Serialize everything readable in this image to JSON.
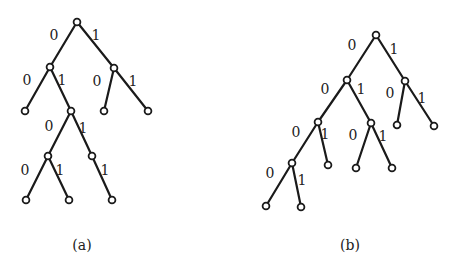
{
  "figures": [
    {
      "id": "a",
      "caption": "(a)",
      "caption_pos": [
        82,
        250
      ],
      "nodes": {
        "root": [
          77,
          22
        ],
        "L": [
          50,
          67
        ],
        "R": [
          114,
          68
        ],
        "LL": [
          25,
          111
        ],
        "LR": [
          71,
          111
        ],
        "RL": [
          104,
          111
        ],
        "RR": [
          148,
          111
        ],
        "LRL": [
          48,
          156
        ],
        "LRR": [
          92,
          156
        ],
        "LRLL": [
          26,
          200
        ],
        "LRLR": [
          69,
          200
        ],
        "LRRR": [
          112,
          200
        ]
      },
      "edges": [
        {
          "from": "root",
          "to": "L",
          "label": "0",
          "lpos": [
            54,
            40
          ]
        },
        {
          "from": "root",
          "to": "R",
          "label": "1",
          "lpos": [
            96,
            40
          ]
        },
        {
          "from": "L",
          "to": "LL",
          "label": "0",
          "lpos": [
            27,
            85
          ]
        },
        {
          "from": "L",
          "to": "LR",
          "label": "1",
          "lpos": [
            62,
            85
          ]
        },
        {
          "from": "R",
          "to": "RL",
          "label": "0",
          "lpos": [
            97,
            86
          ]
        },
        {
          "from": "R",
          "to": "RR",
          "label": "1",
          "lpos": [
            133,
            86
          ]
        },
        {
          "from": "LR",
          "to": "LRL",
          "label": "0",
          "lpos": [
            49,
            131
          ]
        },
        {
          "from": "LR",
          "to": "LRR",
          "label": "1",
          "lpos": [
            83,
            133
          ]
        },
        {
          "from": "LRL",
          "to": "LRLL",
          "label": "0",
          "lpos": [
            25,
            175
          ]
        },
        {
          "from": "LRL",
          "to": "LRLR",
          "label": "1",
          "lpos": [
            60,
            175
          ]
        },
        {
          "from": "LRR",
          "to": "LRRR",
          "label": "1",
          "lpos": [
            105,
            175
          ]
        }
      ]
    },
    {
      "id": "b",
      "caption": "(b)",
      "caption_pos": [
        350,
        250
      ],
      "nodes": {
        "root": [
          376,
          35
        ],
        "L": [
          347,
          80
        ],
        "R": [
          405,
          81
        ],
        "LL": [
          318,
          122
        ],
        "LR": [
          371,
          123
        ],
        "RL": [
          397,
          125
        ],
        "RR": [
          434,
          126
        ],
        "LLL": [
          292,
          163
        ],
        "LLR": [
          328,
          165
        ],
        "LRL": [
          356,
          168
        ],
        "LRR": [
          392,
          168
        ],
        "LLLL": [
          266,
          206
        ],
        "LLLR": [
          301,
          207
        ]
      },
      "edges": [
        {
          "from": "root",
          "to": "L",
          "label": "0",
          "lpos": [
            352,
            50
          ]
        },
        {
          "from": "root",
          "to": "R",
          "label": "1",
          "lpos": [
            394,
            54
          ]
        },
        {
          "from": "L",
          "to": "LL",
          "label": "0",
          "lpos": [
            325,
            94
          ]
        },
        {
          "from": "L",
          "to": "LR",
          "label": "1",
          "lpos": [
            361,
            94
          ]
        },
        {
          "from": "R",
          "to": "RL",
          "label": "0",
          "lpos": [
            390,
            98
          ]
        },
        {
          "from": "R",
          "to": "RR",
          "label": "1",
          "lpos": [
            422,
            103
          ]
        },
        {
          "from": "LL",
          "to": "LLL",
          "label": "0",
          "lpos": [
            296,
            137
          ]
        },
        {
          "from": "LL",
          "to": "LLR",
          "label": "1",
          "lpos": [
            325,
            139
          ]
        },
        {
          "from": "LR",
          "to": "LRL",
          "label": "0",
          "lpos": [
            353,
            140
          ]
        },
        {
          "from": "LR",
          "to": "LRR",
          "label": "1",
          "lpos": [
            383,
            141
          ]
        },
        {
          "from": "LLL",
          "to": "LLLL",
          "label": "0",
          "lpos": [
            270,
            178
          ]
        },
        {
          "from": "LLL",
          "to": "LLLR",
          "label": "1",
          "lpos": [
            302,
            185
          ]
        }
      ]
    }
  ],
  "style": {
    "line_color": "#1a1a1a",
    "node_radius": 3.4,
    "background": "#ffffff"
  }
}
